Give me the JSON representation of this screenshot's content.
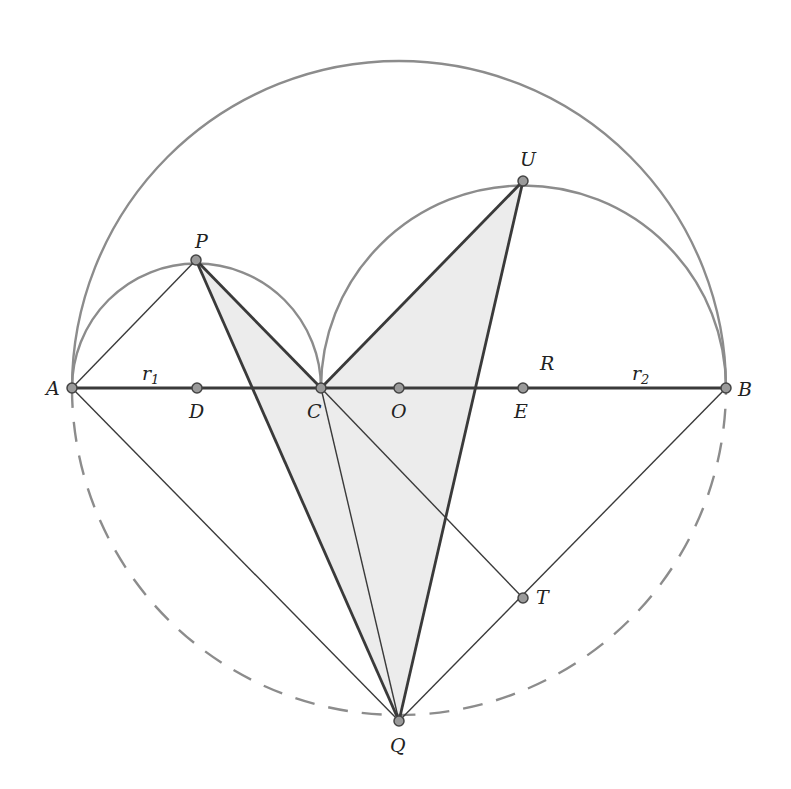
{
  "diagram": {
    "points": {
      "A": {
        "label": "A",
        "x": 72,
        "y": 388
      },
      "D": {
        "label": "D",
        "x": 197,
        "y": 388
      },
      "C": {
        "label": "C",
        "x": 321,
        "y": 388
      },
      "O": {
        "label": "O",
        "x": 399,
        "y": 388
      },
      "E": {
        "label": "E",
        "x": 523,
        "y": 388
      },
      "B": {
        "label": "B",
        "x": 726,
        "y": 388
      },
      "P": {
        "label": "P",
        "x": 196,
        "y": 260
      },
      "U": {
        "label": "U",
        "x": 523,
        "y": 181
      },
      "Q": {
        "label": "Q",
        "x": 399,
        "y": 721
      },
      "T": {
        "label": "T",
        "x": 523,
        "y": 598
      }
    },
    "segment_labels": {
      "r1": {
        "main": "r",
        "sub": "1"
      },
      "r2": {
        "main": "r",
        "sub": "2"
      },
      "R": "R"
    },
    "circles": {
      "big": {
        "center": "O",
        "radius": 327,
        "upper": "solid",
        "lower": "dashed"
      },
      "small_left": {
        "center": "D",
        "radius": 124.5,
        "style": "semicircle"
      },
      "small_right": {
        "center": "E",
        "radius": 202.5,
        "style": "semicircle"
      }
    },
    "shaded_region": "PCUQ",
    "colors": {
      "arc": "#8c8c8c",
      "line": "#3a3a3a",
      "shade": "#ececec",
      "point_fill": "#9a9a9a"
    }
  }
}
